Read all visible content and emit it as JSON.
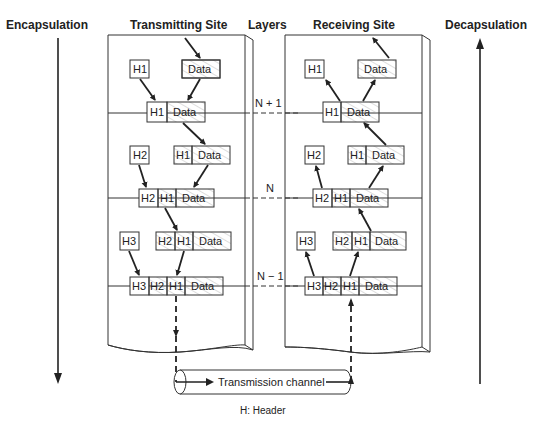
{
  "headers": {
    "encapsulation": "Encapsulation",
    "transmitting_site": "Transmitting Site",
    "layers": "Layers",
    "receiving_site": "Receiving Site",
    "decapsulation": "Decapsulation"
  },
  "layers": [
    {
      "label": "N + 1"
    },
    {
      "label": "N"
    },
    {
      "label": "N − 1"
    }
  ],
  "cells": {
    "h1": "H1",
    "h2": "H2",
    "h3": "H3",
    "data": "Data"
  },
  "channel": {
    "label": "Transmission channel"
  },
  "legend": {
    "text": "H: Header"
  },
  "colors": {
    "ink": "#222222",
    "hatch": "#999999",
    "background": "#ffffff"
  }
}
